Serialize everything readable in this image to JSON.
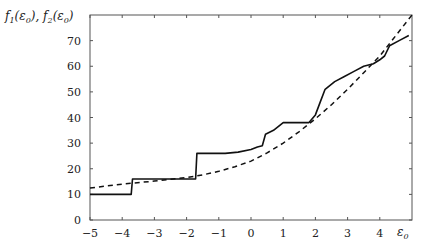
{
  "chart_data": {
    "type": "line",
    "title": "",
    "xlabel": "ε0",
    "ylabel": "f1(ε0), f2(ε0)",
    "xlim": [
      -5,
      5
    ],
    "ylim": [
      0,
      80
    ],
    "grid": false,
    "legend": "none",
    "x_ticks": [
      -5,
      -4,
      -3,
      -2,
      -1,
      0,
      1,
      2,
      3,
      4
    ],
    "y_ticks": [
      0,
      10,
      20,
      30,
      40,
      50,
      60,
      70
    ],
    "series": [
      {
        "name": "f1(ε0)",
        "style": "solid",
        "color": "#111111",
        "x": [
          -5,
          -3.72,
          -3.68,
          -1.72,
          -1.68,
          -0.8,
          -0.4,
          0.0,
          0.2,
          0.35,
          0.45,
          0.7,
          1.0,
          1.8,
          2.0,
          2.15,
          2.3,
          2.6,
          2.9,
          3.2,
          3.5,
          3.8,
          4.0,
          4.15,
          4.3,
          4.6,
          4.9
        ],
        "y": [
          10,
          10,
          16,
          16,
          26,
          26,
          26.5,
          27.5,
          28.5,
          29,
          33.5,
          35,
          38,
          38,
          41,
          46,
          51,
          54,
          56,
          58,
          60,
          61,
          62.5,
          64,
          68,
          70,
          72
        ]
      },
      {
        "name": "f2(ε0)",
        "style": "dashed",
        "color": "#111111",
        "x": [
          -5,
          -4,
          -3,
          -2,
          -1.5,
          -1,
          -0.5,
          0,
          0.5,
          1,
          1.5,
          2,
          2.5,
          3,
          3.5,
          4,
          4.5,
          5
        ],
        "y": [
          12.5,
          14,
          15.2,
          16.6,
          17.6,
          19,
          20.8,
          23,
          26.2,
          30,
          34.5,
          39.5,
          45,
          51,
          57.5,
          64,
          72,
          80
        ]
      }
    ]
  }
}
